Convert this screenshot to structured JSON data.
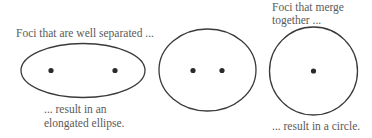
{
  "diagram": {
    "colors": {
      "stroke": "#3a3a3a",
      "focus": "#2a2a2a",
      "text": "#5a5a5a"
    },
    "panels": [
      {
        "name": "elongated-ellipse",
        "caption_top": "Foci that are well separated ...",
        "caption_bottom_line1": "... result in an",
        "caption_bottom_line2": "elongated ellipse.",
        "foci_count": 2
      },
      {
        "name": "mild-ellipse",
        "foci_count": 2
      },
      {
        "name": "circle",
        "caption_top_line1": "Foci that merge",
        "caption_top_line2": "together ...",
        "caption_bottom": "... result in a circle.",
        "foci_count": 1
      }
    ]
  }
}
